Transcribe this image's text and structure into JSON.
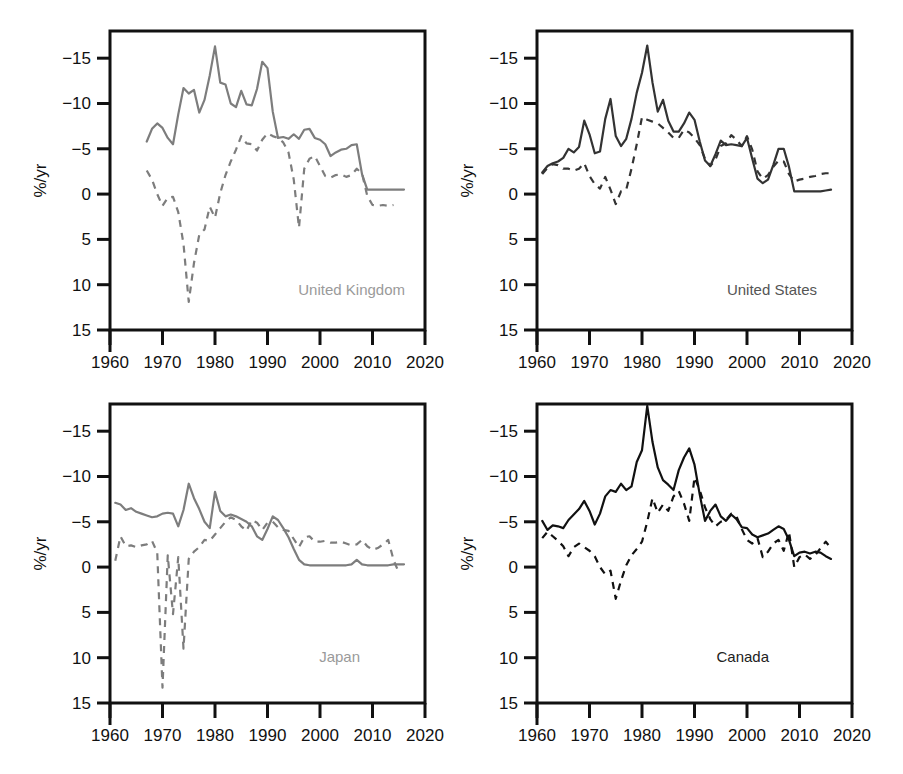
{
  "figure": {
    "width": 903,
    "height": 774,
    "background": "#ffffff",
    "layout": "2x2 grid of line charts"
  },
  "chart_data": [
    {
      "type": "line",
      "title": "United Kingdom",
      "panel": "top-left",
      "xlabel": "",
      "ylabel": "%/yr",
      "xlim": [
        1960,
        2020
      ],
      "ylim": [
        -15,
        18
      ],
      "xticks": [
        1960,
        1970,
        1980,
        1990,
        2000,
        2010,
        2020
      ],
      "yticks": [
        -15,
        -10,
        -5,
        0,
        5,
        10,
        15
      ],
      "grid": false,
      "legend": "none",
      "line_color": "#7d7d7d",
      "series": [
        {
          "name": "solid",
          "style": "solid",
          "x": [
            1967,
            1968,
            1969,
            1970,
            1971,
            1972,
            1973,
            1974,
            1975,
            1976,
            1977,
            1978,
            1979,
            1980,
            1981,
            1982,
            1983,
            1984,
            1985,
            1986,
            1987,
            1988,
            1989,
            1990,
            1991,
            1992,
            1993,
            1994,
            1995,
            1996,
            1997,
            1998,
            1999,
            2000,
            2001,
            2002,
            2003,
            2004,
            2005,
            2006,
            2007,
            2008,
            2009,
            2010,
            2011,
            2012,
            2013,
            2014,
            2015,
            2016
          ],
          "values": [
            5.8,
            7.2,
            7.8,
            7.3,
            6.2,
            5.5,
            8.8,
            11.7,
            11.1,
            11.5,
            9.0,
            10.4,
            13.1,
            16.3,
            12.3,
            12.1,
            10.0,
            9.6,
            11.4,
            9.9,
            9.8,
            11.6,
            14.6,
            13.9,
            9.1,
            6.2,
            6.3,
            6.1,
            6.6,
            6.1,
            7.1,
            7.2,
            6.2,
            6.0,
            5.5,
            4.2,
            4.6,
            4.9,
            5.0,
            5.4,
            5.5,
            2.2,
            0.5,
            0.5,
            0.5,
            0.5,
            0.5,
            0.5,
            0.5,
            0.5
          ]
        },
        {
          "name": "dashed",
          "style": "dashed",
          "x": [
            1967,
            1968,
            1969,
            1970,
            1971,
            1972,
            1973,
            1974,
            1975,
            1976,
            1977,
            1978,
            1979,
            1980,
            1981,
            1982,
            1983,
            1984,
            1985,
            1986,
            1987,
            1988,
            1989,
            1990,
            1991,
            1992,
            1993,
            1994,
            1995,
            1996,
            1997,
            1998,
            1999,
            2000,
            2001,
            2002,
            2003,
            2004,
            2005,
            2006,
            2007,
            2008,
            2009,
            2010,
            2011,
            2012,
            2013,
            2014
          ],
          "values": [
            2.6,
            1.6,
            0.0,
            -1.3,
            -0.4,
            -0.3,
            -2.0,
            -5.5,
            -11.9,
            -7.6,
            -4.5,
            -3.9,
            -1.4,
            -2.6,
            0.1,
            2.1,
            3.6,
            4.9,
            6.4,
            5.6,
            5.5,
            4.8,
            6.0,
            6.7,
            6.4,
            6.2,
            5.7,
            4.6,
            1.6,
            -3.7,
            2.8,
            3.9,
            4.2,
            3.1,
            2.0,
            1.8,
            2.1,
            2.2,
            1.9,
            2.1,
            2.8,
            2.3,
            -0.2,
            -1.2,
            -1.3,
            -1.2,
            -1.3,
            -1.2
          ]
        }
      ]
    },
    {
      "type": "line",
      "title": "United States",
      "panel": "top-right",
      "xlabel": "",
      "ylabel": "%/yr",
      "xlim": [
        1960,
        2020
      ],
      "ylim": [
        -15,
        18
      ],
      "xticks": [
        1960,
        1970,
        1980,
        1990,
        2000,
        2010,
        2020
      ],
      "yticks": [
        -15,
        -10,
        -5,
        0,
        5,
        10,
        15
      ],
      "grid": false,
      "legend": "none",
      "line_color": "#333333",
      "series": [
        {
          "name": "solid",
          "style": "solid",
          "x": [
            1961,
            1962,
            1963,
            1964,
            1965,
            1966,
            1967,
            1968,
            1969,
            1970,
            1971,
            1972,
            1973,
            1974,
            1975,
            1976,
            1977,
            1978,
            1979,
            1980,
            1981,
            1982,
            1983,
            1984,
            1985,
            1986,
            1987,
            1988,
            1989,
            1990,
            1991,
            1992,
            1993,
            1994,
            1995,
            1996,
            1997,
            1998,
            1999,
            2000,
            2001,
            2002,
            2003,
            2004,
            2005,
            2006,
            2007,
            2008,
            2009,
            2010,
            2011,
            2012,
            2013,
            2014,
            2015,
            2016
          ],
          "values": [
            2.4,
            3.1,
            3.4,
            3.6,
            4.0,
            5.0,
            4.6,
            5.2,
            8.1,
            6.6,
            4.5,
            4.7,
            8.3,
            10.5,
            6.4,
            5.3,
            6.1,
            8.3,
            11.2,
            13.4,
            16.4,
            12.3,
            9.1,
            10.4,
            8.1,
            6.9,
            6.9,
            7.8,
            9.0,
            8.2,
            5.8,
            3.7,
            3.1,
            4.4,
            5.9,
            5.4,
            5.5,
            5.4,
            5.3,
            6.2,
            3.9,
            1.7,
            1.2,
            1.6,
            3.2,
            5.0,
            5.0,
            3.0,
            0.3,
            0.3,
            0.3,
            0.3,
            0.3,
            0.3,
            0.4,
            0.5
          ]
        },
        {
          "name": "dashed",
          "style": "dashed",
          "x": [
            1961,
            1962,
            1963,
            1964,
            1965,
            1966,
            1967,
            1968,
            1969,
            1970,
            1971,
            1972,
            1973,
            1974,
            1975,
            1976,
            1977,
            1978,
            1979,
            1980,
            1981,
            1982,
            1983,
            1984,
            1985,
            1986,
            1987,
            1988,
            1989,
            1990,
            1991,
            1992,
            1993,
            1994,
            1995,
            1996,
            1997,
            1998,
            1999,
            2000,
            2001,
            2002,
            2003,
            2004,
            2005,
            2006,
            2007,
            2008,
            2009,
            2010,
            2011,
            2012,
            2013,
            2014,
            2015,
            2016
          ],
          "values": [
            2.2,
            2.9,
            3.3,
            3.2,
            2.8,
            2.8,
            2.6,
            2.8,
            3.4,
            2.0,
            1.1,
            0.6,
            1.9,
            0.5,
            -1.1,
            0.3,
            0.5,
            2.8,
            5.5,
            8.5,
            8.2,
            8.0,
            7.8,
            7.3,
            6.8,
            6.2,
            6.2,
            7.1,
            6.8,
            6.2,
            5.4,
            3.9,
            3.1,
            3.8,
            5.3,
            5.6,
            6.5,
            6.0,
            5.3,
            6.4,
            4.9,
            2.5,
            1.7,
            2.1,
            3.0,
            3.7,
            3.6,
            2.2,
            1.4,
            1.6,
            1.7,
            1.9,
            2.0,
            2.2,
            2.3,
            2.3
          ]
        }
      ]
    },
    {
      "type": "line",
      "title": "Japan",
      "panel": "bottom-left",
      "xlabel": "",
      "ylabel": "%/yr",
      "xlim": [
        1960,
        2020
      ],
      "ylim": [
        -15,
        18
      ],
      "xticks": [
        1960,
        1970,
        1980,
        1990,
        2000,
        2010,
        2020
      ],
      "yticks": [
        -15,
        -10,
        -5,
        0,
        5,
        10,
        15
      ],
      "grid": false,
      "legend": "none",
      "line_color": "#7d7d7d",
      "series": [
        {
          "name": "solid",
          "style": "solid",
          "x": [
            1961,
            1962,
            1963,
            1964,
            1965,
            1966,
            1967,
            1968,
            1969,
            1970,
            1971,
            1972,
            1973,
            1974,
            1975,
            1976,
            1977,
            1978,
            1979,
            1980,
            1981,
            1982,
            1983,
            1984,
            1985,
            1986,
            1987,
            1988,
            1989,
            1990,
            1991,
            1992,
            1993,
            1994,
            1995,
            1996,
            1997,
            1998,
            1999,
            2000,
            2001,
            2002,
            2003,
            2004,
            2005,
            2006,
            2007,
            2008,
            2009,
            2010,
            2011,
            2012,
            2013,
            2014,
            2015,
            2016
          ],
          "values": [
            7.1,
            6.9,
            6.3,
            6.5,
            6.1,
            5.9,
            5.7,
            5.5,
            5.6,
            5.9,
            6.0,
            5.9,
            4.5,
            6.3,
            9.2,
            7.6,
            6.4,
            5.0,
            4.3,
            8.3,
            6.2,
            5.6,
            5.8,
            5.6,
            5.3,
            5.0,
            4.5,
            3.4,
            3.0,
            4.2,
            5.6,
            5.2,
            4.3,
            3.3,
            2.0,
            0.8,
            0.3,
            0.2,
            0.2,
            0.2,
            0.2,
            0.2,
            0.2,
            0.2,
            0.2,
            0.3,
            0.8,
            0.3,
            0.2,
            0.2,
            0.2,
            0.2,
            0.2,
            0.3,
            0.3,
            0.3
          ]
        },
        {
          "name": "dashed",
          "style": "dashed",
          "x": [
            1961,
            1962,
            1963,
            1964,
            1965,
            1966,
            1967,
            1968,
            1969,
            1970,
            1971,
            1972,
            1973,
            1974,
            1975,
            1976,
            1977,
            1978,
            1979,
            1980,
            1981,
            1982,
            1983,
            1984,
            1985,
            1986,
            1987,
            1988,
            1989,
            1990,
            1991,
            1992,
            1993,
            1994,
            1995,
            1996,
            1997,
            1998,
            1999,
            2000,
            2001,
            2002,
            2003,
            2004,
            2005,
            2006,
            2007,
            2008,
            2009,
            2010,
            2011,
            2012,
            2013,
            2014,
            2015
          ],
          "values": [
            0.7,
            3.4,
            2.3,
            2.4,
            2.2,
            2.4,
            2.5,
            2.9,
            1.6,
            -13.3,
            1.3,
            -5.2,
            1.1,
            -9.0,
            0.9,
            1.7,
            2.2,
            3.0,
            2.9,
            3.6,
            4.3,
            5.0,
            5.5,
            5.2,
            4.5,
            4.0,
            5.2,
            4.9,
            4.1,
            4.9,
            5.0,
            4.4,
            4.1,
            4.0,
            3.1,
            2.2,
            3.3,
            3.4,
            2.8,
            2.8,
            2.9,
            2.7,
            2.7,
            2.8,
            2.6,
            2.4,
            2.5,
            3.0,
            2.3,
            1.9,
            2.1,
            2.5,
            3.0,
            0.8,
            -0.6
          ]
        }
      ]
    },
    {
      "type": "line",
      "title": "Canada",
      "panel": "bottom-right",
      "xlabel": "",
      "ylabel": "%/yr",
      "xlim": [
        1960,
        2020
      ],
      "ylim": [
        -15,
        18
      ],
      "xticks": [
        1960,
        1970,
        1980,
        1990,
        2000,
        2010,
        2020
      ],
      "yticks": [
        -15,
        -10,
        -5,
        0,
        5,
        10,
        15
      ],
      "grid": false,
      "legend": "none",
      "line_color": "#111111",
      "series": [
        {
          "name": "solid",
          "style": "solid",
          "x": [
            1961,
            1962,
            1963,
            1964,
            1965,
            1966,
            1967,
            1968,
            1969,
            1970,
            1971,
            1972,
            1973,
            1974,
            1975,
            1976,
            1977,
            1978,
            1979,
            1980,
            1981,
            1982,
            1983,
            1984,
            1985,
            1986,
            1987,
            1988,
            1989,
            1990,
            1991,
            1992,
            1993,
            1994,
            1995,
            1996,
            1997,
            1998,
            1999,
            2000,
            2001,
            2002,
            2003,
            2004,
            2005,
            2006,
            2007,
            2008,
            2009,
            2010,
            2011,
            2012,
            2013,
            2014,
            2015,
            2016
          ],
          "values": [
            5.1,
            4.1,
            4.6,
            4.5,
            4.3,
            5.2,
            5.8,
            6.4,
            7.3,
            6.2,
            4.7,
            5.9,
            7.8,
            8.5,
            8.3,
            9.2,
            8.5,
            8.9,
            11.6,
            12.9,
            17.8,
            13.8,
            11.0,
            9.6,
            9.1,
            8.5,
            10.7,
            12.1,
            13.1,
            11.3,
            8.0,
            5.1,
            6.2,
            6.9,
            5.6,
            5.1,
            5.8,
            5.3,
            4.4,
            4.3,
            3.6,
            3.3,
            3.5,
            3.7,
            4.1,
            4.5,
            4.2,
            3.0,
            1.2,
            1.6,
            1.7,
            1.5,
            1.7,
            1.6,
            1.2,
            0.9
          ]
        },
        {
          "name": "dashed",
          "style": "dashed",
          "x": [
            1961,
            1962,
            1963,
            1964,
            1965,
            1966,
            1967,
            1968,
            1969,
            1970,
            1971,
            1972,
            1973,
            1974,
            1975,
            1976,
            1977,
            1978,
            1979,
            1980,
            1981,
            1982,
            1983,
            1984,
            1985,
            1986,
            1987,
            1988,
            1989,
            1990,
            1991,
            1992,
            1993,
            1994,
            1995,
            1996,
            1997,
            1998,
            1999,
            2000,
            2001,
            2002,
            2003,
            2004,
            2005,
            2006,
            2007,
            2008,
            2009,
            2010,
            2011,
            2012,
            2013,
            2014,
            2015,
            2016
          ],
          "values": [
            3.2,
            3.9,
            3.4,
            2.9,
            2.3,
            1.2,
            2.2,
            2.6,
            2.2,
            1.8,
            1.2,
            0.0,
            -0.8,
            -0.4,
            -3.5,
            -1.5,
            0.2,
            1.3,
            2.0,
            2.8,
            5.0,
            7.6,
            6.0,
            6.9,
            6.2,
            7.8,
            8.4,
            7.0,
            5.1,
            9.9,
            8.5,
            6.6,
            5.3,
            4.5,
            5.0,
            5.2,
            5.9,
            5.6,
            4.2,
            3.0,
            2.6,
            3.2,
            1.1,
            1.7,
            2.6,
            3.0,
            1.8,
            3.9,
            0.0,
            1.1,
            1.4,
            0.9,
            1.3,
            2.1,
            2.8,
            2.1
          ]
        }
      ]
    }
  ],
  "axis": {
    "y_title": "%/yr",
    "y_ticklabels": [
      "15",
      "10",
      "5",
      "0",
      "−5",
      "−10",
      "−15"
    ],
    "x_ticklabels": [
      "1960",
      "1970",
      "1980",
      "1990",
      "2000",
      "2010",
      "2020"
    ]
  },
  "labels": {
    "uk": "United Kingdom",
    "us": "United States",
    "jp": "Japan",
    "ca": "Canada"
  },
  "colors": {
    "uk_line": "#7d7d7d",
    "us_line": "#333333",
    "jp_line": "#7d7d7d",
    "ca_line": "#111111",
    "uk_label": "#9a9a9a",
    "us_label": "#555555",
    "jp_label": "#9a9a9a",
    "ca_label": "#222222",
    "axis": "#111111"
  }
}
